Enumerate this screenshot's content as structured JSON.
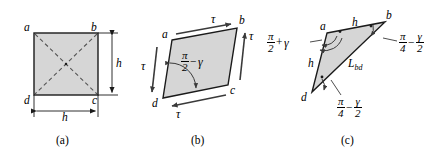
{
  "figure": {
    "type": "engineering-diagram",
    "panels": [
      {
        "id": "a",
        "caption": "(a)",
        "shape": "square",
        "vertices": [
          {
            "label": "a",
            "position": "top-left"
          },
          {
            "label": "b",
            "position": "top-right"
          },
          {
            "label": "c",
            "position": "bottom-right"
          },
          {
            "label": "d",
            "position": "bottom-left"
          }
        ],
        "diagonals": [
          "a-c",
          "b-d"
        ],
        "dimensions": [
          {
            "label": "h",
            "orientation": "vertical",
            "side": "right"
          },
          {
            "label": "h",
            "orientation": "horizontal",
            "side": "bottom"
          }
        ]
      },
      {
        "id": "b",
        "caption": "(b)",
        "shape": "parallelogram",
        "vertices": [
          {
            "label": "a",
            "position": "top-left"
          },
          {
            "label": "b",
            "position": "top-right"
          },
          {
            "label": "c",
            "position": "bottom-right"
          },
          {
            "label": "d",
            "position": "bottom-left"
          }
        ],
        "stress_labels": [
          {
            "label": "τ",
            "edge": "top",
            "direction": "right"
          },
          {
            "label": "τ",
            "edge": "right",
            "direction": "up"
          },
          {
            "label": "τ",
            "edge": "bottom",
            "direction": "left"
          },
          {
            "label": "τ",
            "edge": "left",
            "direction": "down"
          }
        ],
        "angle": {
          "vertex": "d",
          "numerator": "π",
          "denominator": "2",
          "operator": "−",
          "term": "γ"
        }
      },
      {
        "id": "c",
        "caption": "(c)",
        "shape": "triangle",
        "vertices": [
          {
            "label": "a",
            "position": "top-left"
          },
          {
            "label": "b",
            "position": "top-right"
          },
          {
            "label": "d",
            "position": "bottom-left"
          }
        ],
        "side_labels": [
          {
            "label": "h",
            "edge": "a-b"
          },
          {
            "label": "h",
            "edge": "a-d"
          },
          {
            "label": "L",
            "sub": "bd",
            "edge": "b-d"
          }
        ],
        "angles": [
          {
            "vertex": "a",
            "numerator": "π",
            "denominator": "2",
            "operator": "+",
            "term": "γ"
          },
          {
            "vertex": "b",
            "numerator": "π",
            "denominator": "4",
            "operator": "−",
            "term_numerator": "γ",
            "term_denominator": "2"
          },
          {
            "vertex": "d",
            "numerator": "π",
            "denominator": "4",
            "operator": "−",
            "term_numerator": "γ",
            "term_denominator": "2"
          }
        ]
      }
    ],
    "colors": {
      "fill": "#d6d6d6",
      "stroke": "#1a1a1a",
      "dashed": "#555555",
      "background": "#ffffff"
    }
  }
}
